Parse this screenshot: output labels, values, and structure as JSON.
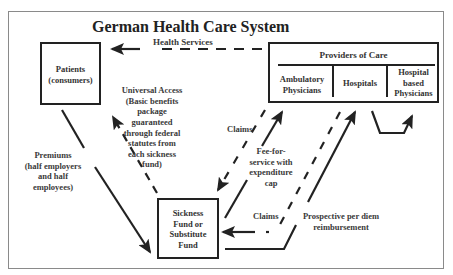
{
  "title": "German Health Care System",
  "nodes": {
    "patients": {
      "line1": "Patients",
      "line2": "(consumers)"
    },
    "providers": {
      "header": "Providers of Care",
      "columns": [
        {
          "line1": "Ambulatory",
          "line2": "Physicians"
        },
        {
          "line1": "Hospitals"
        },
        {
          "line1": "Hospital",
          "line2": "based",
          "line3": "Physicians"
        }
      ]
    },
    "sickness_fund": {
      "line1": "Sickness",
      "line2": "Fund or",
      "line3": "Substitute",
      "line4": "Fund"
    }
  },
  "edges": {
    "health_services": "Health Services",
    "universal_access": {
      "line1": "Universal Access",
      "line2": "(Basic benefits",
      "line3": "package",
      "line4": "guaranteed",
      "line5": "through federal",
      "line6": "statutes from",
      "line7": "each sickness",
      "line8": "fund)"
    },
    "premiums": {
      "line1": "Premiums",
      "line2": "(half employers",
      "line3": "and half",
      "line4": "employees)"
    },
    "claims_ambulatory": "Claims",
    "fee_for_service": {
      "line1": "Fee-for-",
      "line2": "service with",
      "line3": "expenditure",
      "line4": "cap"
    },
    "claims_hospitals": "Claims",
    "prospective": {
      "line1": "Prospective per diem",
      "line2": "reimbursement"
    }
  },
  "colors": {
    "line": "#222222",
    "frame": "#8a8a8a",
    "text": "#333333"
  }
}
